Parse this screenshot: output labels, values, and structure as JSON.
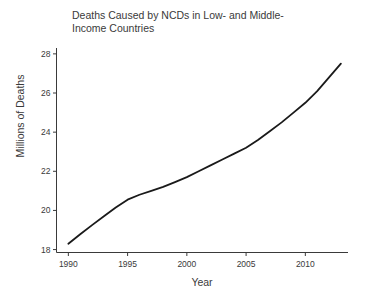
{
  "chart_data": {
    "type": "line",
    "title": "Deaths Caused by NCDs in Low- and Middle-Income Countries",
    "title_line1": "Deaths Caused by NCDs in Low- and Middle-",
    "title_line2": "Income Countries",
    "xlabel": "Year",
    "ylabel": "Millions of Deaths",
    "xlim": [
      1989.0,
      2013.6
    ],
    "ylim": [
      17.85,
      28.3
    ],
    "xticks": [
      1990,
      1995,
      2000,
      2005,
      2010
    ],
    "xtick_labels": [
      "1990",
      "1995",
      "2000",
      "2005",
      "2010"
    ],
    "yticks": [
      18,
      20,
      22,
      24,
      26,
      28
    ],
    "ytick_labels": [
      "18",
      "20",
      "22",
      "24",
      "26",
      "28"
    ],
    "grid": false,
    "legend": null,
    "line_color": "#1a1a1a",
    "line_width": 1.8,
    "x": [
      1990,
      1991,
      1992,
      1993,
      1994,
      1995,
      1996,
      1997,
      1998,
      1999,
      2000,
      2001,
      2002,
      2003,
      2004,
      2005,
      2006,
      2007,
      2008,
      2009,
      2010,
      2011,
      2012,
      2013
    ],
    "values": [
      18.3,
      18.78,
      19.25,
      19.7,
      20.15,
      20.55,
      20.8,
      21.0,
      21.2,
      21.45,
      21.7,
      22.0,
      22.3,
      22.6,
      22.9,
      23.2,
      23.6,
      24.05,
      24.5,
      25.0,
      25.5,
      26.1,
      26.8,
      27.5
    ],
    "series": [
      {
        "name": "NCD deaths",
        "values": [
          18.3,
          18.78,
          19.25,
          19.7,
          20.15,
          20.55,
          20.8,
          21.0,
          21.2,
          21.45,
          21.7,
          22.0,
          22.3,
          22.6,
          22.9,
          23.2,
          23.6,
          24.05,
          24.5,
          25.0,
          25.5,
          26.1,
          26.8,
          27.5
        ]
      }
    ]
  }
}
